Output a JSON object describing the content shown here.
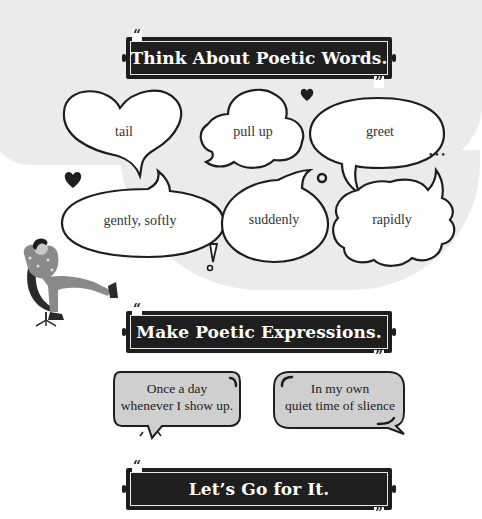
{
  "sections": {
    "think": {
      "title": "Think About Poetic Words."
    },
    "make": {
      "title": "Make Poetic Expressions."
    },
    "go": {
      "title": "Let’s Go for It."
    }
  },
  "quote_marks": {
    "open": "“",
    "close": "”"
  },
  "words": [
    {
      "label": "tail",
      "shape": "heart"
    },
    {
      "label": "pull up",
      "shape": "cloud"
    },
    {
      "label": "greet",
      "shape": "oval"
    },
    {
      "label": "gently, softly",
      "shape": "oval"
    },
    {
      "label": "suddenly",
      "shape": "oval"
    },
    {
      "label": "rapidly",
      "shape": "cloud"
    }
  ],
  "expressions": [
    {
      "line1": "Once a day",
      "line2": "whenever I show up."
    },
    {
      "line1": "In my own",
      "line2": "quiet time of slience"
    }
  ],
  "decorations": {
    "ellipsis": "•••",
    "exclamation": "!"
  },
  "colors": {
    "banner_bg": "#1e1e1e",
    "banner_text": "#ffffff",
    "bubble_fill": "#ffffff",
    "bubble_stroke": "#1e1e1e",
    "expr_fill": "#cfcfcf",
    "background_blob": "#ebebeb",
    "figure_body": "#8a8a8a"
  }
}
